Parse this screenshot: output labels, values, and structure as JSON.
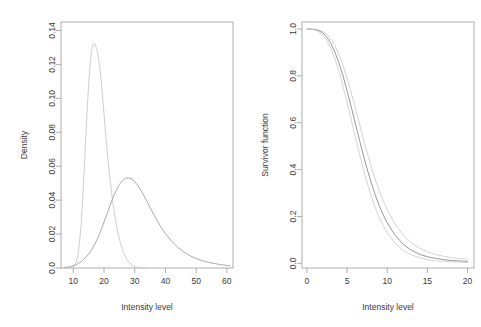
{
  "figure": {
    "width": 481,
    "height": 327,
    "background": "#ffffff",
    "panels": 2
  },
  "chart_data": [
    {
      "panel": "left",
      "type": "line",
      "title": "",
      "xlabel": "Intensity level",
      "ylabel": "Density",
      "xlim": [
        6,
        62
      ],
      "ylim": [
        0,
        0.145
      ],
      "xticks": [
        10,
        20,
        30,
        40,
        50,
        60
      ],
      "xticklabels": [
        "10",
        "20",
        "30",
        "40",
        "50",
        "60"
      ],
      "yticks": [
        0.0,
        0.02,
        0.04,
        0.06,
        0.08,
        0.1,
        0.12,
        0.14
      ],
      "yticklabels": [
        "0.0",
        "0.02",
        "0.04",
        "0.06",
        "0.08",
        "0.10",
        "0.12",
        "0.14"
      ],
      "grid": false,
      "legend": "none",
      "series": [
        {
          "name": "narrow-density",
          "color": "#c8c8c8",
          "width": 0.9,
          "peak_x": 18.5,
          "peak_y": 0.132,
          "x": [
            8.0,
            9.0,
            10.0,
            11.0,
            11.5,
            12.0,
            12.5,
            13.0,
            13.5,
            14.0,
            14.5,
            15.0,
            15.5,
            16.0,
            16.5,
            17.0,
            17.5,
            18.0,
            18.5,
            19.0,
            19.5,
            20.0,
            20.5,
            21.0,
            21.5,
            22.0,
            22.5,
            23.0,
            23.5,
            24.0,
            24.5,
            25.0,
            25.5,
            26.0,
            26.5,
            27.0,
            27.5,
            28.0,
            28.5,
            29.0,
            29.5,
            30.0,
            30.5,
            31.0,
            31.5,
            32.0,
            32.5,
            33.0,
            33.5
          ],
          "y": [
            0.0,
            0.0,
            0.0005,
            0.0035,
            0.0075,
            0.0145,
            0.0245,
            0.0385,
            0.0555,
            0.074,
            0.0925,
            0.1085,
            0.1205,
            0.1285,
            0.132,
            0.1322,
            0.13,
            0.126,
            0.12,
            0.112,
            0.102,
            0.091,
            0.08,
            0.0695,
            0.06,
            0.0515,
            0.044,
            0.0372,
            0.0312,
            0.0258,
            0.0212,
            0.0172,
            0.0138,
            0.011,
            0.0086,
            0.0066,
            0.005,
            0.0037,
            0.0027,
            0.0019,
            0.0013,
            0.0009,
            0.0006,
            0.0004,
            0.0002,
            0.0001,
            0.0001,
            0.0,
            0.0
          ]
        },
        {
          "name": "broad-density",
          "color": "#a0a0a0",
          "width": 0.9,
          "peak_x": 28.0,
          "peak_y": 0.0532,
          "x": [
            7.0,
            9.0,
            11.0,
            13.0,
            15.0,
            16.0,
            17.0,
            18.0,
            19.0,
            20.0,
            21.0,
            22.0,
            23.0,
            24.0,
            25.0,
            26.0,
            27.0,
            28.0,
            29.0,
            30.0,
            31.0,
            32.0,
            33.0,
            34.0,
            35.0,
            36.0,
            37.0,
            38.0,
            39.0,
            40.0,
            42.0,
            44.0,
            46.0,
            48.0,
            50.0,
            52.0,
            54.0,
            56.0,
            58.0,
            60.0,
            61.0
          ],
          "y": [
            0.0002,
            0.0008,
            0.002,
            0.0043,
            0.0082,
            0.0108,
            0.014,
            0.0178,
            0.0222,
            0.027,
            0.032,
            0.037,
            0.0417,
            0.0458,
            0.0492,
            0.0516,
            0.0529,
            0.0532,
            0.0525,
            0.0509,
            0.0486,
            0.0458,
            0.0426,
            0.0392,
            0.0357,
            0.0322,
            0.0289,
            0.0258,
            0.0229,
            0.0203,
            0.0158,
            0.0122,
            0.0094,
            0.0072,
            0.0056,
            0.0043,
            0.0033,
            0.0026,
            0.002,
            0.0015,
            0.0013
          ]
        }
      ]
    },
    {
      "panel": "right",
      "type": "line",
      "title": "",
      "xlabel": "Intensity level",
      "ylabel": "Survivor function",
      "xlim": [
        -0.6,
        20.8
      ],
      "ylim": [
        -0.02,
        1.03
      ],
      "xticks": [
        0,
        5,
        10,
        15,
        20
      ],
      "xticklabels": [
        "0",
        "5",
        "10",
        "15",
        "20"
      ],
      "yticks": [
        0.0,
        0.2,
        0.4,
        0.6,
        0.8,
        1.0
      ],
      "yticklabels": [
        "0.0",
        "0.2",
        "0.4",
        "0.6",
        "0.8",
        "1.0"
      ],
      "grid": false,
      "legend": "none",
      "series": [
        {
          "name": "survivor-upper-band",
          "color": "#cfcfcf",
          "width": 0.9,
          "x": [
            0,
            0.5,
            1,
            1.5,
            2,
            2.5,
            3,
            3.5,
            4,
            4.5,
            5,
            5.5,
            6,
            6.5,
            7,
            7.5,
            8,
            8.5,
            9,
            9.5,
            10,
            11,
            12,
            13,
            14,
            15,
            16,
            17,
            18,
            19,
            20
          ],
          "y": [
            1.0,
            1.0,
            0.999,
            0.996,
            0.99,
            0.978,
            0.958,
            0.93,
            0.892,
            0.846,
            0.792,
            0.731,
            0.667,
            0.602,
            0.537,
            0.474,
            0.415,
            0.36,
            0.311,
            0.267,
            0.229,
            0.166,
            0.12,
            0.087,
            0.065,
            0.049,
            0.038,
            0.03,
            0.024,
            0.02,
            0.017
          ]
        },
        {
          "name": "survivor-estimate",
          "color": "#8a8a8a",
          "width": 0.9,
          "x": [
            0,
            0.5,
            1,
            1.5,
            2,
            2.5,
            3,
            3.5,
            4,
            4.5,
            5,
            5.5,
            6,
            6.5,
            7,
            7.5,
            8,
            8.5,
            9,
            9.5,
            10,
            11,
            12,
            13,
            14,
            15,
            16,
            17,
            18,
            19,
            20
          ],
          "y": [
            1.0,
            1.0,
            0.998,
            0.993,
            0.983,
            0.965,
            0.938,
            0.901,
            0.855,
            0.8,
            0.738,
            0.671,
            0.602,
            0.533,
            0.466,
            0.403,
            0.345,
            0.293,
            0.247,
            0.207,
            0.173,
            0.119,
            0.081,
            0.056,
            0.039,
            0.028,
            0.021,
            0.016,
            0.012,
            0.01,
            0.008
          ]
        },
        {
          "name": "survivor-lower-band",
          "color": "#cfcfcf",
          "width": 0.9,
          "x": [
            0,
            0.5,
            1,
            1.5,
            2,
            2.5,
            3,
            3.5,
            4,
            4.5,
            5,
            5.5,
            6,
            6.5,
            7,
            7.5,
            8,
            8.5,
            9,
            9.5,
            10,
            11,
            12,
            13,
            14,
            15,
            16,
            17,
            18,
            19,
            20
          ],
          "y": [
            1.0,
            0.999,
            0.996,
            0.988,
            0.974,
            0.95,
            0.916,
            0.872,
            0.818,
            0.756,
            0.688,
            0.616,
            0.544,
            0.473,
            0.406,
            0.344,
            0.288,
            0.239,
            0.197,
            0.161,
            0.131,
            0.085,
            0.055,
            0.036,
            0.024,
            0.016,
            0.011,
            0.008,
            0.006,
            0.005,
            0.004
          ]
        }
      ]
    }
  ]
}
